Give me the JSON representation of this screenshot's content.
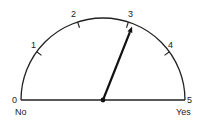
{
  "gauge": {
    "title": "",
    "min": 0,
    "max": 5,
    "value": 3.1,
    "ticks": [
      "0",
      "1",
      "2",
      "3",
      "4",
      "5"
    ],
    "left_label": "No",
    "right_label": "Yes",
    "colors": {
      "stroke": "#222222",
      "background": "#ffffff"
    }
  }
}
